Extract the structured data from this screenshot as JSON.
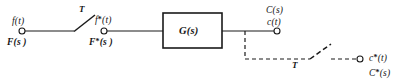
{
  "diagram": {
    "type": "control-system-block-diagram",
    "background_color": "#ffffff",
    "line_color": "#1a1a1a",
    "nodes": [
      {
        "id": "input-terminal",
        "name": "input-terminal",
        "shape": "circle",
        "x": 22,
        "y": 31,
        "radius": 3,
        "labels_above": [
          "f(t)"
        ],
        "labels_below": [
          "F(s )"
        ]
      },
      {
        "id": "sampled-input-terminal",
        "name": "sampled-input-terminal",
        "shape": "circle",
        "x": 104,
        "y": 31,
        "radius": 3,
        "labels_above": [
          "f*(t)"
        ],
        "labels_below": [
          "F*(s )"
        ]
      },
      {
        "id": "output-terminal",
        "name": "output-terminal",
        "shape": "circle",
        "x": 277,
        "y": 31,
        "radius": 3,
        "labels_above": [
          "C(s)",
          "c(t)"
        ],
        "labels_below": []
      },
      {
        "id": "sampled-output-terminal",
        "name": "sampled-output-terminal",
        "shape": "circle",
        "x": 360,
        "y": 59,
        "radius": 3,
        "labels_right": [
          "c*(t)",
          "C*(s)"
        ]
      }
    ],
    "blocks": [
      {
        "id": "transfer-function-block",
        "name": "transfer-function-block",
        "label": "G(s)",
        "x": 163,
        "y": 13,
        "width": 59,
        "height": 35
      }
    ],
    "switches": [
      {
        "id": "input-sampler-switch",
        "name": "input-sampler-switch",
        "label": "T",
        "style": "solid",
        "pivot_x": 74,
        "pivot_y": 31,
        "blade_end_x": 95,
        "blade_end_y": 15,
        "label_x": 80,
        "label_y": 9
      },
      {
        "id": "output-sampler-switch",
        "name": "output-sampler-switch",
        "label": "T",
        "style": "dashed",
        "pivot_x": 310,
        "pivot_y": 59,
        "blade_end_x": 331,
        "blade_end_y": 44,
        "label_x": 295,
        "label_y": 62
      }
    ],
    "wires": [
      {
        "id": "input-wire",
        "name": "input-wire",
        "style": "solid",
        "points": "25,31 74,31"
      },
      {
        "id": "sampled-input-wire",
        "name": "sampled-input-wire",
        "style": "solid",
        "points": "107,31 163,31"
      },
      {
        "id": "block-output-wire",
        "name": "block-output-wire",
        "style": "solid",
        "points": "222,31 274,31"
      },
      {
        "id": "output-feed-dashed-wire",
        "name": "output-feed-dashed-wire",
        "style": "dashed",
        "points": "245,31 245,59 310,59"
      },
      {
        "id": "sampled-output-dashed-wire",
        "name": "sampled-output-dashed-wire",
        "style": "dashed",
        "points": "331,59 357,59"
      }
    ],
    "labels": {
      "input_time": "f(t)",
      "input_laplace": "F(s )",
      "sampled_input_time_base": "f",
      "sampled_input_time_rest": "(t)",
      "sampled_input_laplace_base": "F",
      "sampled_input_laplace_rest": "(s )",
      "block_transfer_function": "G(s)",
      "output_laplace": "C(s)",
      "output_time": "c(t)",
      "sampled_output_time_base": "c",
      "sampled_output_time_rest": "(t)",
      "sampled_output_laplace_base": "C",
      "sampled_output_laplace_rest": "(s)",
      "star": "*",
      "switch_period_input": "T",
      "switch_period_output": "T"
    }
  }
}
